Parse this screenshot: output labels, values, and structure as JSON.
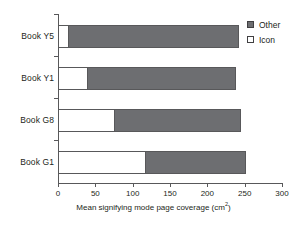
{
  "chart_data": {
    "type": "bar",
    "orientation": "horizontal",
    "stacked": true,
    "title": "",
    "xlabel": "Mean signifying mode page coverage (cm²)",
    "xlabel_text": "Mean signifying mode page coverage (cm",
    "xlabel_sup": "2",
    "xlabel_tail": ")",
    "ylabel": "",
    "categories": [
      "Book Y5",
      "Book Y1",
      "Book G8",
      "Book G1"
    ],
    "series": [
      {
        "name": "Icon",
        "color": "#ffffff",
        "values": [
          14,
          39,
          75,
          116
        ]
      },
      {
        "name": "Other",
        "color": "#6d6e71",
        "values": [
          228,
          199,
          170,
          136
        ]
      }
    ],
    "totals": [
      242,
      238,
      245,
      252
    ],
    "xlim": [
      0,
      300
    ],
    "xticks": [
      0,
      50,
      100,
      150,
      200,
      250,
      300
    ],
    "xtick_labels": [
      "0",
      "50",
      "100",
      "150",
      "200",
      "250",
      "300"
    ],
    "grid": false,
    "legend_position": "top-right",
    "legend_entries": [
      {
        "label": "Other",
        "swatch": "filled"
      },
      {
        "label": "Icon",
        "swatch": "hollow"
      }
    ]
  },
  "axis": {
    "line_color": "#58585a"
  }
}
